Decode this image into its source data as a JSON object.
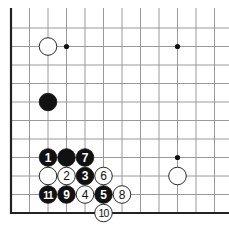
{
  "board": {
    "origin_x": 11,
    "origin_y": 28,
    "spacing": 18.5,
    "cols_visible": 12,
    "rows_visible": 10,
    "right_extent": 229,
    "top_extent": 8,
    "line_color": "#9a9a9a",
    "edge_color": "#222222",
    "edges": [
      "left",
      "bottom"
    ]
  },
  "star_points": [
    {
      "col": 3,
      "row": 1
    },
    {
      "col": 9,
      "row": 1
    },
    {
      "col": 9,
      "row": 7
    }
  ],
  "stones": [
    {
      "col": 2,
      "row": 1,
      "color": "white",
      "label": ""
    },
    {
      "col": 2,
      "row": 4,
      "color": "black",
      "label": ""
    },
    {
      "col": 2,
      "row": 7,
      "color": "black",
      "label": "1"
    },
    {
      "col": 3,
      "row": 7,
      "color": "black",
      "label": ""
    },
    {
      "col": 4,
      "row": 7,
      "color": "black",
      "label": "7"
    },
    {
      "col": 2,
      "row": 8,
      "color": "white",
      "label": ""
    },
    {
      "col": 3,
      "row": 8,
      "color": "white",
      "label": "2"
    },
    {
      "col": 4,
      "row": 8,
      "color": "black",
      "label": "3"
    },
    {
      "col": 5,
      "row": 8,
      "color": "white",
      "label": "6"
    },
    {
      "col": 2,
      "row": 9,
      "color": "black",
      "label": "11"
    },
    {
      "col": 3,
      "row": 9,
      "color": "black",
      "label": "9"
    },
    {
      "col": 4,
      "row": 9,
      "color": "white",
      "label": "4"
    },
    {
      "col": 5,
      "row": 9,
      "color": "black",
      "label": "5"
    },
    {
      "col": 6,
      "row": 9,
      "color": "white",
      "label": "8"
    },
    {
      "col": 5,
      "row": 10,
      "color": "white",
      "label": "10"
    },
    {
      "col": 9,
      "row": 8,
      "color": "white",
      "label": ""
    }
  ]
}
